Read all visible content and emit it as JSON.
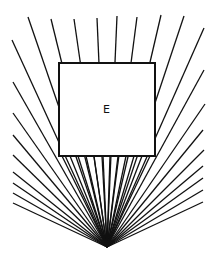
{
  "diagram": {
    "box_label": "E",
    "apex": [
      107,
      247
    ],
    "box": {
      "x": 59,
      "y": 63,
      "w": 96,
      "h": 93
    },
    "stroke_color": "#111111",
    "ray_endpoints": [
      [
        12,
        40
      ],
      [
        28,
        17
      ],
      [
        51,
        19
      ],
      [
        74,
        19
      ],
      [
        97,
        18
      ],
      [
        117,
        16
      ],
      [
        137,
        17
      ],
      [
        161,
        15
      ],
      [
        184,
        16
      ],
      [
        204,
        28
      ],
      [
        13,
        82
      ],
      [
        13,
        113
      ],
      [
        13,
        135
      ],
      [
        13,
        155
      ],
      [
        13,
        172
      ],
      [
        13,
        183
      ],
      [
        13,
        193
      ],
      [
        13,
        203
      ],
      [
        204,
        70
      ],
      [
        205,
        104
      ],
      [
        203,
        130
      ],
      [
        204,
        150
      ],
      [
        203,
        166
      ],
      [
        203,
        178
      ],
      [
        203,
        190
      ],
      [
        203,
        202
      ],
      [
        62,
        156
      ],
      [
        70,
        156
      ],
      [
        78,
        156
      ],
      [
        86,
        156
      ],
      [
        94,
        156
      ],
      [
        102,
        156
      ],
      [
        110,
        156
      ],
      [
        118,
        156
      ],
      [
        126,
        156
      ],
      [
        134,
        156
      ],
      [
        142,
        156
      ],
      [
        150,
        156
      ]
    ]
  }
}
